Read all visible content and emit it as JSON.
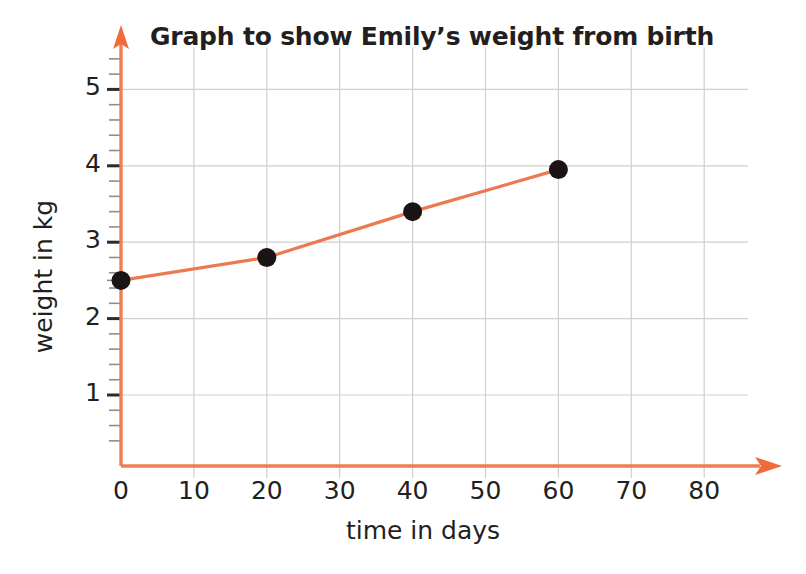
{
  "chart_data": {
    "type": "line",
    "title": "Graph to show Emily’s weight from birth",
    "xlabel": "time in days",
    "ylabel": "weight in kg",
    "x": [
      0,
      20,
      40,
      60
    ],
    "values": [
      2.5,
      2.8,
      3.4,
      3.95
    ],
    "series": [
      {
        "name": "Emily’s weight",
        "x": [
          0,
          20,
          40,
          60
        ],
        "values": [
          2.5,
          2.8,
          3.4,
          3.95
        ]
      }
    ],
    "xlim": [
      0,
      88
    ],
    "ylim": [
      0.3,
      5.55
    ],
    "x_ticks": [
      0,
      10,
      20,
      30,
      40,
      50,
      60,
      70,
      80
    ],
    "x_tick_labels": [
      "0",
      "10",
      "20",
      "30",
      "40",
      "50",
      "60",
      "70",
      "80"
    ],
    "y_ticks": [
      1,
      2,
      3,
      4,
      5
    ],
    "y_tick_labels": [
      "1",
      "2",
      "3",
      "4",
      "5"
    ],
    "y_minor_tick_step": 0.2,
    "grid": true,
    "legend": null,
    "legend_position": "none",
    "marker": "filled-circle",
    "colors": {
      "line": "#ee7950",
      "axis": "#ef7f52",
      "marker": "#1a1415",
      "grid": "#cfcfcf",
      "tick": "#5b5b5b",
      "text": "#231f20",
      "background": "#ffffff"
    },
    "annotations": []
  },
  "axes": {
    "x_arrow": "right-arrow-icon",
    "y_arrow": "up-arrow-icon"
  }
}
